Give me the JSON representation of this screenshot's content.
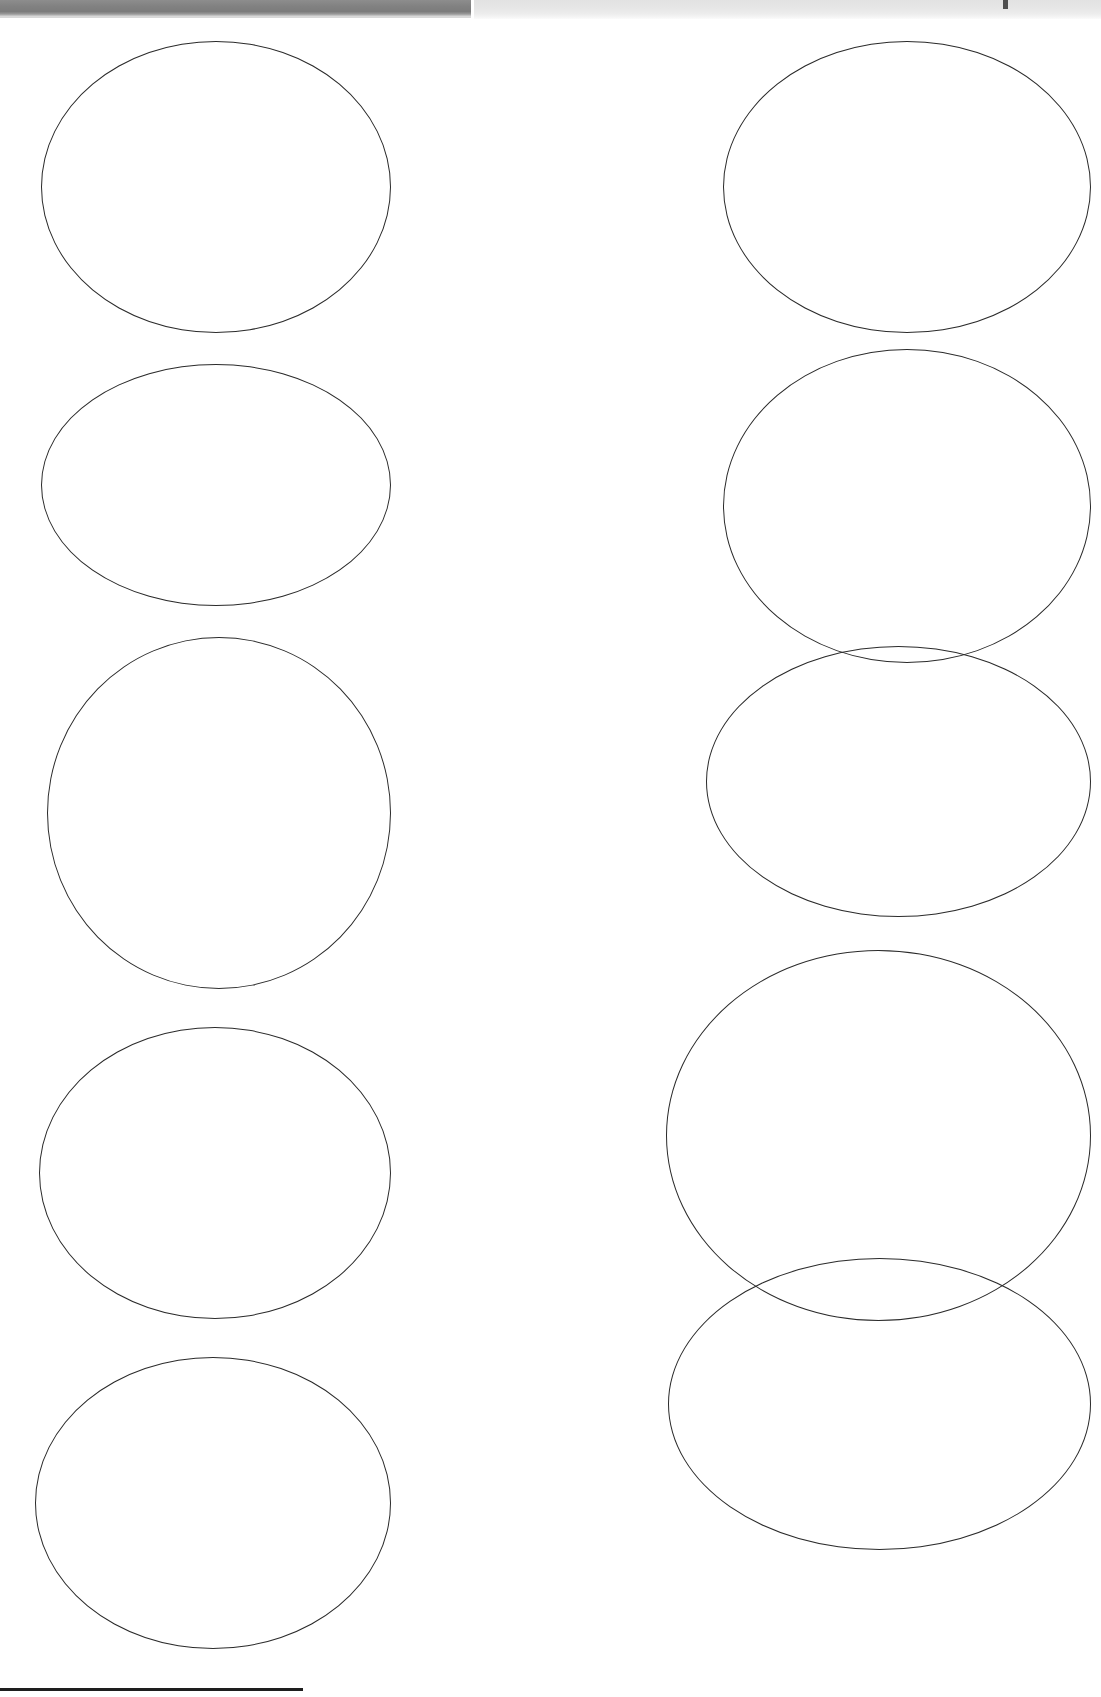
{
  "page": {
    "width": 1101,
    "height": 1697,
    "background_color": "#ffffff",
    "ink_color": "#2b2b2b"
  },
  "scan_artifacts": {
    "top_bar_dark": {
      "name": "dark-scan-bar",
      "color": "#828282",
      "x": 0,
      "y": 0,
      "width": 471,
      "height": 16
    },
    "top_bar_light": {
      "name": "light-scan-bar",
      "color": "#e6e6e6",
      "x": 474,
      "y": 0,
      "width": 627,
      "height": 19
    },
    "tick_mark": {
      "name": "registration-tick",
      "color": "#4f4f4f",
      "x": 1003,
      "y": 0,
      "width": 5,
      "height": 9
    }
  },
  "bottom_rule": {
    "name": "bottom-horizontal-rule",
    "color": "#1e1e1e",
    "x": 0,
    "y": 1688,
    "width": 303,
    "height": 3
  },
  "label_grid": {
    "columns": 2,
    "rows": 5,
    "count": 10,
    "shape": "ellipse",
    "ovals": [
      {
        "id": "oval-r1-c1",
        "row": 1,
        "col": 1,
        "x": 41,
        "y": 41,
        "width": 350,
        "height": 292
      },
      {
        "id": "oval-r1-c2",
        "row": 1,
        "col": 2,
        "x": 723,
        "y": 41,
        "width": 368,
        "height": 292
      },
      {
        "id": "oval-r2-c1",
        "row": 2,
        "col": 1,
        "x": 41,
        "y": 364,
        "width": 350,
        "height": 242
      },
      {
        "id": "oval-r2-c2",
        "row": 2,
        "col": 2,
        "x": 723,
        "y": 349,
        "width": 368,
        "height": 314
      },
      {
        "id": "oval-r3-c1",
        "row": 3,
        "col": 1,
        "x": 47,
        "y": 637,
        "width": 344,
        "height": 352
      },
      {
        "id": "oval-r3-c2",
        "row": 3,
        "col": 2,
        "x": 706,
        "y": 646,
        "width": 385,
        "height": 271
      },
      {
        "id": "oval-r4-c1",
        "row": 4,
        "col": 1,
        "x": 39,
        "y": 1027,
        "width": 352,
        "height": 292
      },
      {
        "id": "oval-r4-c2",
        "row": 4,
        "col": 2,
        "x": 666,
        "y": 950,
        "width": 425,
        "height": 371
      },
      {
        "id": "oval-r5-c1",
        "row": 5,
        "col": 1,
        "x": 35,
        "y": 1357,
        "width": 356,
        "height": 292
      },
      {
        "id": "oval-r5-c2",
        "row": 5,
        "col": 2,
        "x": 668,
        "y": 1258,
        "width": 423,
        "height": 292
      }
    ]
  }
}
